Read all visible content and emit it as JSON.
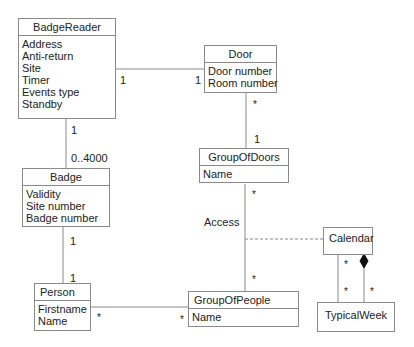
{
  "classes": {
    "badge_reader": {
      "name": "BadgeReader",
      "attrs": [
        "Address",
        "Anti-return",
        "Site",
        "Timer",
        "Events type",
        "Standby"
      ]
    },
    "door": {
      "name": "Door",
      "attrs": [
        "Door number",
        "Room number"
      ]
    },
    "badge": {
      "name": "Badge",
      "attrs": [
        "Validity",
        "Site number",
        "Badge number"
      ]
    },
    "group_of_doors": {
      "name": "GroupOfDoors",
      "attrs": [
        "Name"
      ]
    },
    "person": {
      "name": "Person",
      "attrs": [
        "Firstname",
        "Name"
      ]
    },
    "group_of_people": {
      "name": "GroupOfPeople",
      "attrs": [
        "Name"
      ]
    },
    "calendar": {
      "name": "Calendar",
      "attrs": []
    },
    "typical_week": {
      "name": "TypicalWeek",
      "attrs": []
    }
  },
  "associations": {
    "reader_door": {
      "reader_end": "1",
      "door_end": "1"
    },
    "reader_badge": {
      "reader_end": "1",
      "badge_end": "0..4000"
    },
    "door_group": {
      "door_end": "*",
      "group_end": "1"
    },
    "badge_person": {
      "badge_end": "1",
      "person_end": "1"
    },
    "person_group": {
      "person_end": "*",
      "group_end": "*"
    },
    "access": {
      "label": "Access",
      "doors_end": "*",
      "people_end": "*"
    },
    "calendar_week": {
      "cal_end": "*",
      "week_end": "*",
      "composition_week_end": "*"
    }
  }
}
